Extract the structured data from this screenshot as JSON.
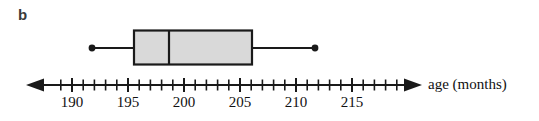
{
  "panel": {
    "label": "b"
  },
  "axis": {
    "title": "age (months)",
    "unit": "months",
    "tick_labels": [
      "190",
      "195",
      "200",
      "205",
      "210",
      "215"
    ],
    "tick_values": [
      190,
      195,
      200,
      205,
      210,
      215
    ],
    "minor_tick_step": 1,
    "axis_min": 188.5,
    "axis_max": 219,
    "left_arrow": true,
    "right_arrow": true
  },
  "colors": {
    "stroke": "#1a1a1a",
    "box_fill": "#d9d9d9",
    "label_text": "#3a3a3a",
    "background": "#ffffff"
  },
  "chart_data": {
    "type": "boxplot",
    "title": "",
    "xlabel": "age (months)",
    "ylabel": "",
    "xlim": [
      188.5,
      219
    ],
    "grid": false,
    "legend": null,
    "orientation": "horizontal",
    "series": [
      {
        "name": "b",
        "min": 192,
        "q1": 195.5,
        "median": 198,
        "q3": 204.5,
        "max": 210,
        "iqr": 9,
        "whisker_endpoint_markers": "filled-circle",
        "outliers": []
      }
    ]
  }
}
